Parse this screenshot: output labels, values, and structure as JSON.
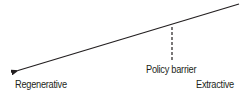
{
  "diagram": {
    "labels": {
      "left_end": "Regenerative",
      "right_end": "Extractive",
      "barrier": "Policy barrier"
    },
    "elements": {
      "main_line": {
        "from": [
          239,
          4
        ],
        "to": [
          16,
          71
        ],
        "arrowhead": "left",
        "color": "#231f20"
      },
      "barrier_marker": {
        "x": 172,
        "y_top": 27,
        "y_bottom": 60,
        "style": "dashed",
        "color": "#231f20"
      }
    }
  }
}
